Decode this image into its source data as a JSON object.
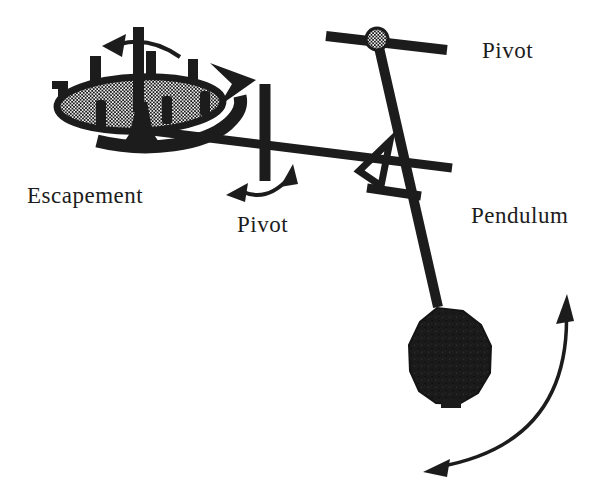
{
  "figure": {
    "background_color": "#ffffff",
    "ink_color": "#1c1c1c",
    "labels": {
      "escapement": "Escapement",
      "pivot_middle": "Pivot",
      "pivot_top": "Pivot",
      "pendulum": "Pendulum"
    },
    "components": [
      "escape-wheel",
      "wheel-tooth",
      "wheel-axle",
      "verge-pallet",
      "wheel-rotation-arrow",
      "wheel-rotation-arrowhead",
      "crutch-rod",
      "verge-pivot-rod",
      "pivot-oscillation-arrow",
      "pendulum-support-bar",
      "pivot-bearing",
      "pendulum-rod",
      "suspension-triangle",
      "fork-crossbar",
      "pendulum-bob",
      "swing-arc-arrow"
    ]
  }
}
